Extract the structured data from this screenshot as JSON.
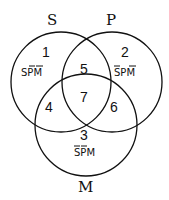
{
  "sets": {
    "S": {
      "label": "S"
    },
    "P": {
      "label": "P"
    },
    "M": {
      "label": "M"
    }
  },
  "regions": [
    {
      "number": "1",
      "term": "SPM",
      "negated": [
        "P",
        "M"
      ]
    },
    {
      "number": "2",
      "term": "SPM",
      "negated": [
        "S",
        "M"
      ]
    },
    {
      "number": "3",
      "term": "SPM",
      "negated": [
        "S",
        "P"
      ]
    },
    {
      "number": "4",
      "term": ""
    },
    {
      "number": "5",
      "term": ""
    },
    {
      "number": "6",
      "term": ""
    },
    {
      "number": "7",
      "term": ""
    }
  ]
}
